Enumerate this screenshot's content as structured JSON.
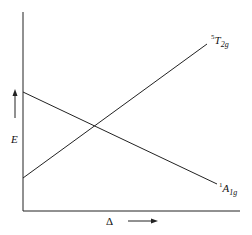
{
  "diagram": {
    "type": "energy-correlation",
    "y_axis_label": "E",
    "x_axis_label": "Δ",
    "states": [
      {
        "name": "5T2g",
        "multiplicity": "5",
        "term": "T",
        "subscript": "2g",
        "trend": "increasing with Δ"
      },
      {
        "name": "1A1g",
        "multiplicity": "1",
        "term": "A",
        "subscript": "1g",
        "trend": "decreasing with Δ"
      }
    ],
    "colors": {
      "line": "#222222",
      "background": "#ffffff"
    }
  }
}
